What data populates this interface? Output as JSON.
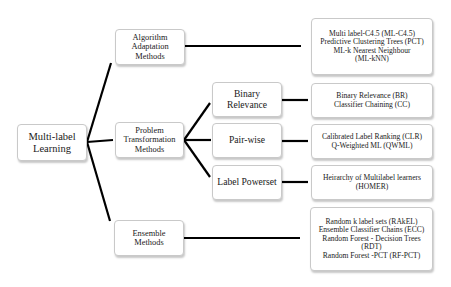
{
  "diagram": {
    "type": "tree",
    "root": {
      "label": "Multi-label\nLearning"
    },
    "categories": [
      {
        "id": "algorithm-adaptation",
        "label": "Algorithm\nAdaptation\nMethods",
        "methods": "Multi label-C4.5 (ML-C4.5)\nPredictive Clustering Trees (PCT)\nML-k Nearest Neighbour\n(ML-kNN)"
      },
      {
        "id": "problem-transformation",
        "label": "Problem\nTransformation\nMethods",
        "subcategories": [
          {
            "id": "binary-relevance",
            "label": "Binary\nRelevance",
            "methods": "Binary Relevance (BR)\nClassifier Chaining (CC)"
          },
          {
            "id": "pair-wise",
            "label": "Pair-wise",
            "methods": "Calibrated Label Ranking (CLR)\nQ-Weighted ML (QWML)"
          },
          {
            "id": "label-powerset",
            "label": "Label Powerset",
            "methods": "Heirarchy of Multilabel learners\n(HOMER)"
          }
        ]
      },
      {
        "id": "ensemble",
        "label": "Ensemble Methods",
        "methods": "Random k label sets (RAkEL)\nEnsemble Classifier Chains (ECC)\nRandom Forest - Decision Trees\n(RDT)\nRandom Forest -PCT (RF-PCT)"
      }
    ]
  },
  "colors": {
    "connector": "#000000",
    "node_border": "#c9c9c9",
    "node_fill": "#ffffff",
    "text": "#1a1a1a"
  }
}
